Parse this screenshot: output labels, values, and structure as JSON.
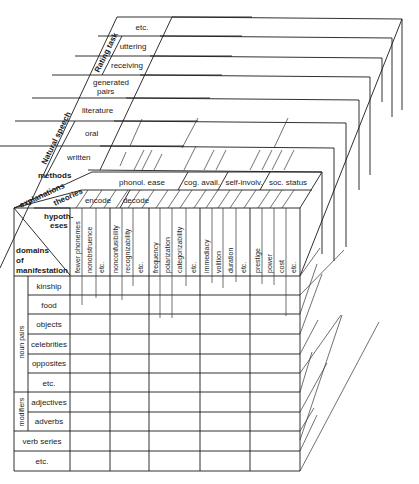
{
  "top_face": {
    "depth_axes": [
      {
        "group": "Rating task",
        "items": [
          "etc.",
          "uttering",
          "receiving"
        ]
      },
      {
        "group": "",
        "items": [
          "generated pairs",
          "literature"
        ]
      },
      {
        "group": "Natural speech",
        "items": [
          "oral",
          "written"
        ]
      }
    ],
    "rows": [
      {
        "label": "etc."
      },
      {
        "label": "uttering"
      },
      {
        "label": "receiving"
      },
      {
        "label": "generated"
      },
      {
        "label": "literature"
      },
      {
        "label": "oral"
      },
      {
        "label": "written"
      }
    ],
    "generated_line2": "pairs",
    "rating_task_label": "Rating task",
    "natural_speech_label": "Natural speech",
    "methods_label": "methods"
  },
  "header": {
    "explanations_label": "explanations",
    "theories_label": "theories",
    "hypotheses_label_1": "hypoth-",
    "hypotheses_label_2": "eses",
    "domains_label_1": "domains",
    "domains_label_2": "of",
    "domains_label_3": "manifestation",
    "theories": [
      "phonol. ease",
      "cog. avail.",
      "self-involv.",
      "soc. status"
    ],
    "sub_theories": [
      "encode",
      "decode"
    ],
    "hypotheses": [
      "fewer phonemes",
      "nonobstruence",
      "etc.",
      "nonconfusibility",
      "recognizability",
      "etc.",
      "frequency",
      "polarization",
      "categorizability",
      "etc.",
      "immediacy",
      "volition",
      "duration",
      "etc.",
      "prestige",
      "power",
      "cost",
      "etc."
    ]
  },
  "domains": {
    "groups": [
      {
        "label": "noun pairs",
        "items": [
          "kinship",
          "food",
          "objects",
          "celebrities",
          "opposites",
          "etc."
        ]
      },
      {
        "label": "modifiers",
        "items": [
          "adjectives",
          "adverbs"
        ]
      }
    ],
    "standalone": [
      "verb series",
      "etc."
    ]
  }
}
